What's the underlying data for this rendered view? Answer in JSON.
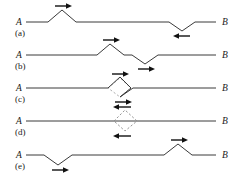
{
  "figure": {
    "title": "",
    "endpoint_left": "A",
    "endpoint_right": "B",
    "panels": [
      {
        "id": "a",
        "label": "(a)",
        "left_label": "A",
        "right_label": "B",
        "baseline_y": 22,
        "features": [
          {
            "kind": "peak",
            "x": 62,
            "amplitude": 12,
            "half_width": 14,
            "arrow": "right",
            "arrow_side": "above"
          },
          {
            "kind": "valley",
            "x": 182,
            "amplitude": 9,
            "half_width": 13,
            "arrow": "left",
            "arrow_side": "below"
          }
        ]
      },
      {
        "id": "b",
        "label": "(b)",
        "left_label": "A",
        "right_label": "B",
        "baseline_y": 55,
        "features": [
          {
            "kind": "peak",
            "x": 110,
            "amplitude": 11,
            "half_width": 14,
            "arrow": "right",
            "arrow_side": "above"
          },
          {
            "kind": "valley",
            "x": 145,
            "amplitude": 9,
            "half_width": 13,
            "arrow": "right",
            "arrow_side": "below"
          }
        ]
      },
      {
        "id": "c",
        "label": "(c)",
        "left_label": "A",
        "right_label": "B",
        "baseline_y": 88,
        "features": [
          {
            "kind": "peak",
            "x": 120,
            "amplitude": 11,
            "half_width": 12,
            "arrow": "right",
            "arrow_side": "above"
          },
          {
            "kind": "valley",
            "x": 130,
            "amplitude": 9,
            "half_width": 11,
            "arrow": "right",
            "arrow_side": "below"
          }
        ]
      },
      {
        "id": "d",
        "label": "(d)",
        "left_label": "A",
        "right_label": "B",
        "baseline_y": 121,
        "features": [
          {
            "kind": "annihilation",
            "x": 125,
            "amplitude": 11,
            "half_width": 11,
            "arrow": "left",
            "arrow_side": "above",
            "arrow2": "left",
            "arrow2_side": "below"
          }
        ]
      },
      {
        "id": "e",
        "label": "(e)",
        "left_label": "A",
        "right_label": "B",
        "baseline_y": 155,
        "features": [
          {
            "kind": "valley",
            "x": 58,
            "amplitude": 10,
            "half_width": 14,
            "arrow": "right",
            "arrow_side": "below"
          },
          {
            "kind": "peak",
            "x": 178,
            "amplitude": 11,
            "half_width": 14,
            "arrow": "right",
            "arrow_side": "above"
          }
        ]
      }
    ],
    "style": {
      "line_color": "#3a3a3a",
      "dashed_color": "#8a8a8a",
      "arrow_color": "#111111",
      "background": "#ffffff",
      "line_width": 1
    }
  }
}
